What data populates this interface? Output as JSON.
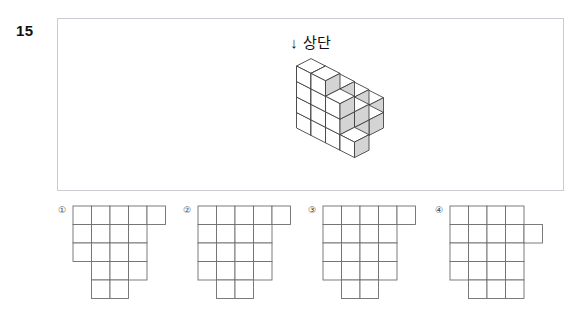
{
  "question": {
    "number": "15",
    "top_label_arrow": "↓",
    "top_label_text": "상단"
  },
  "figure": {
    "name": "isometric-cube-stack",
    "cube_face_top": "#ffffff",
    "cube_face_left": "#ffffff",
    "cube_face_right": "#d4d4d4",
    "stroke": "#3a3a3a",
    "columns": [
      {
        "col": 0,
        "row": 0,
        "height": 1
      },
      {
        "col": 0,
        "row": 1,
        "height": 2
      },
      {
        "col": 0,
        "row": 2,
        "height": 3
      },
      {
        "col": 1,
        "row": 0,
        "height": 1
      },
      {
        "col": 1,
        "row": 1,
        "height": 2
      },
      {
        "col": 1,
        "row": 2,
        "height": 3
      },
      {
        "col": 1,
        "row": 3,
        "height": 4
      },
      {
        "col": 2,
        "row": 0,
        "height": 1
      },
      {
        "col": 2,
        "row": 1,
        "height": 2
      },
      {
        "col": 2,
        "row": 2,
        "height": 3
      },
      {
        "col": 2,
        "row": 3,
        "height": 4
      },
      {
        "col": 3,
        "row": 1,
        "height": 1
      },
      {
        "col": 3,
        "row": 2,
        "height": 2
      },
      {
        "col": 3,
        "row": 3,
        "height": 3
      },
      {
        "col": 4,
        "row": 3,
        "height": 1
      }
    ]
  },
  "options": [
    {
      "marker": "①",
      "name": "option-1",
      "cols": 5,
      "rows": 5,
      "cells": [
        [
          1,
          1,
          1,
          1,
          1
        ],
        [
          1,
          1,
          1,
          1,
          0
        ],
        [
          1,
          1,
          1,
          1,
          0
        ],
        [
          0,
          1,
          1,
          1,
          0
        ],
        [
          0,
          1,
          1,
          0,
          0
        ]
      ]
    },
    {
      "marker": "②",
      "name": "option-2",
      "cols": 5,
      "rows": 5,
      "cells": [
        [
          1,
          1,
          1,
          1,
          1
        ],
        [
          1,
          1,
          1,
          1,
          0
        ],
        [
          1,
          1,
          1,
          1,
          0
        ],
        [
          1,
          1,
          1,
          1,
          0
        ],
        [
          0,
          1,
          1,
          0,
          0
        ]
      ]
    },
    {
      "marker": "③",
      "name": "option-3",
      "cols": 5,
      "rows": 5,
      "cells": [
        [
          1,
          1,
          1,
          1,
          1
        ],
        [
          1,
          1,
          1,
          1,
          0
        ],
        [
          1,
          1,
          1,
          1,
          0
        ],
        [
          1,
          1,
          1,
          1,
          0
        ],
        [
          0,
          1,
          1,
          0,
          0
        ]
      ]
    },
    {
      "marker": "④",
      "name": "option-4",
      "cols": 5,
      "rows": 5,
      "cells": [
        [
          1,
          1,
          1,
          1,
          0
        ],
        [
          1,
          1,
          1,
          1,
          1
        ],
        [
          1,
          1,
          1,
          1,
          0
        ],
        [
          1,
          1,
          1,
          1,
          0
        ],
        [
          0,
          1,
          1,
          1,
          0
        ]
      ]
    }
  ],
  "style": {
    "panel_border": "#c9cdd2",
    "grid_line": "#6e6e6e",
    "text": "#111111"
  }
}
